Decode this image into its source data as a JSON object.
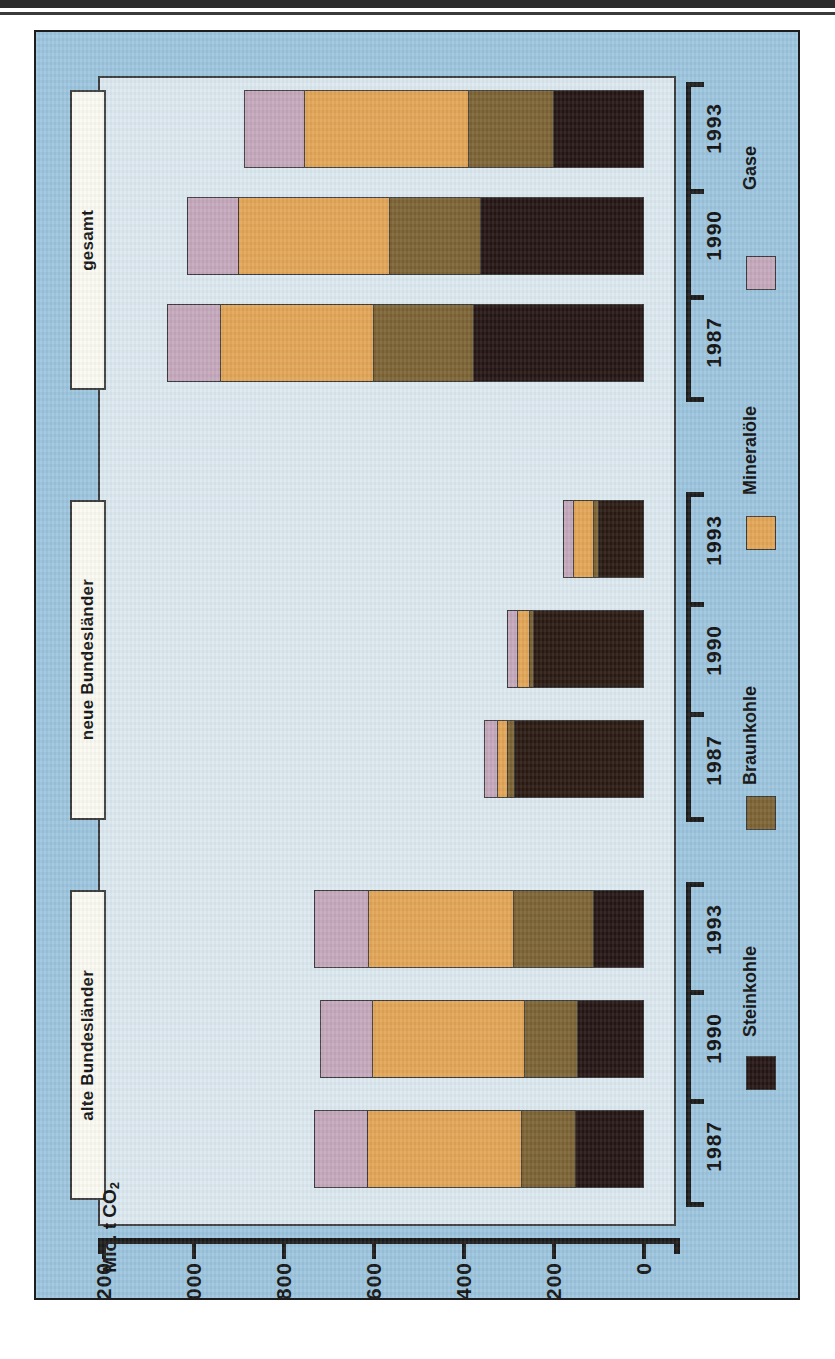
{
  "chart_data": {
    "type": "bar",
    "orientation": "horizontal-stacked-rotated",
    "title": "",
    "ylabel": "Mio. t CO2",
    "axis_unit_label": "Mio. t CO",
    "axis_unit_sub": "2",
    "xlabel": "",
    "axis_ticks": [
      1200,
      1000,
      800,
      600,
      400,
      200,
      0
    ],
    "axis_tick_labels": [
      "1200",
      "1 000",
      "800",
      "600",
      "400",
      "200",
      "0"
    ],
    "ylim": [
      0,
      1200
    ],
    "grid": false,
    "legend_position": "right",
    "series": [
      {
        "name": "Steinkohle",
        "color": "#241513",
        "key": "stein"
      },
      {
        "name": "Braunkohle",
        "color": "#7c6334",
        "key": "braun"
      },
      {
        "name": "Mineralöle",
        "color": "#e2a556",
        "key": "oel"
      },
      {
        "name": "Gase",
        "color": "#c5a8bc",
        "key": "gase"
      }
    ],
    "groups": [
      {
        "label": "alte Bundesländer",
        "categories": [
          "1987",
          "1990",
          "1993"
        ],
        "bars": [
          {
            "year": "1987",
            "gase": 116,
            "oel": 345,
            "braun": 120,
            "stein": 152,
            "total": 733
          },
          {
            "year": "1990",
            "gase": 113,
            "oel": 340,
            "braun": 120,
            "stein": 147,
            "total": 720
          },
          {
            "year": "1993",
            "gase": 118,
            "oel": 324,
            "braun": 180,
            "stein": 111,
            "total": 733
          }
        ]
      },
      {
        "label": "neue Bundesländer",
        "categories": [
          "1987",
          "1990",
          "1993"
        ],
        "bars": [
          {
            "year": "1987",
            "gase": 27,
            "oel": 22,
            "braun": 16,
            "stein": 291,
            "total": 356
          },
          {
            "year": "1990",
            "gase": 20,
            "oel": 27,
            "braun": 9,
            "stein": 249,
            "total": 305
          },
          {
            "year": "1993",
            "gase": 20,
            "oel": 44,
            "braun": 13,
            "stein": 102,
            "total": 179
          }
        ]
      },
      {
        "label": "gesamt",
        "categories": [
          "1987",
          "1990",
          "1993"
        ],
        "bars": [
          {
            "year": "1987",
            "gase": 116,
            "oel": 342,
            "braun": 222,
            "stein": 380,
            "total": 1060
          },
          {
            "year": "1990",
            "gase": 111,
            "oel": 336,
            "braun": 204,
            "stein": 364,
            "total": 1015
          },
          {
            "year": "1993",
            "gase": 131,
            "oel": 367,
            "braun": 191,
            "stein": 200,
            "total": 889
          }
        ]
      }
    ]
  },
  "axis": {
    "title_text": "Mio. t CO",
    "title_sub": "2",
    "labels": [
      "1200",
      "1 000",
      "800",
      "600",
      "400",
      "200",
      "0"
    ]
  },
  "legend": {
    "items": [
      {
        "label": "Steinkohle",
        "swatch": "stein"
      },
      {
        "label": "Braunkohle",
        "swatch": "braun"
      },
      {
        "label": "Mineralöle",
        "swatch": "oel"
      },
      {
        "label": "Gase",
        "swatch": "gase"
      }
    ]
  },
  "groups": {
    "alte": "alte Bundesländer",
    "neue": "neue Bundesländer",
    "gesamt": "gesamt"
  },
  "years": {
    "y1987": "1987",
    "y1990": "1990",
    "y1993": "1993"
  },
  "colors": {
    "background": "#9cc5de",
    "panel": "#dce9f0",
    "steinkohle": "#241513",
    "braunkohle": "#7c6334",
    "mineraloele": "#e2a556",
    "gase": "#c5a8bc"
  }
}
